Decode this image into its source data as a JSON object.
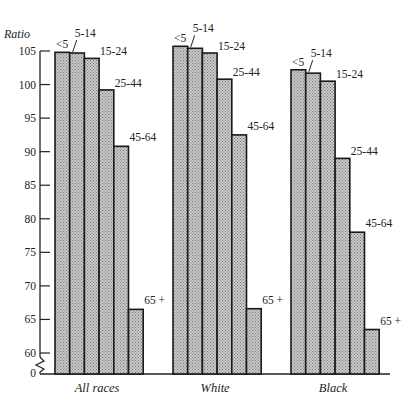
{
  "chart_data": {
    "type": "bar",
    "title": "",
    "xlabel": "",
    "ylabel": "Ratio",
    "ylim": [
      60,
      105
    ],
    "axis_break": true,
    "axis_break_label": "0",
    "yticks": [
      105,
      100,
      95,
      90,
      85,
      80,
      75,
      70,
      65,
      60
    ],
    "grid": false,
    "legend": "none (age-group labels placed above each bar)",
    "categories": [
      "All races",
      "White",
      "Black"
    ],
    "age_groups": [
      "<5",
      "5-14",
      "15-24",
      "25-44",
      "45-64",
      "65 +"
    ],
    "series": [
      {
        "name": "<5",
        "values": [
          104.8,
          105.7,
          102.2
        ]
      },
      {
        "name": "5-14",
        "values": [
          104.7,
          105.4,
          101.7
        ]
      },
      {
        "name": "15-24",
        "values": [
          103.9,
          104.7,
          100.5
        ]
      },
      {
        "name": "25-44",
        "values": [
          99.2,
          100.8,
          89.0
        ]
      },
      {
        "name": "45-64",
        "values": [
          90.8,
          92.5,
          78.0
        ]
      },
      {
        "name": "65 +",
        "values": [
          66.5,
          66.6,
          63.5
        ]
      }
    ],
    "bar_fill": "#b8b8b8",
    "bar_stroke": "#1a1a1a"
  },
  "labels": {
    "ylabel": "Ratio",
    "zero": "0",
    "categories": [
      "All races",
      "White",
      "Black"
    ]
  }
}
